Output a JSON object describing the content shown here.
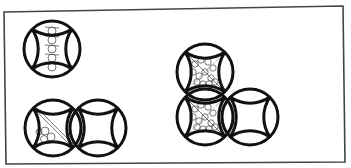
{
  "figure": {
    "width": 351,
    "height": 168,
    "background": "#ffffff",
    "stroke_color": "#111111",
    "frame": {
      "points": [
        [
          4,
          12
        ],
        [
          343,
          6
        ],
        [
          345,
          162
        ],
        [
          6,
          164
        ]
      ],
      "stroke_width": 1.6,
      "color": "#444444"
    },
    "motif_radius": 28,
    "motif_stroke_width": 3,
    "groups": [
      {
        "name": "single-motif",
        "motifs": [
          {
            "cx": 52,
            "cy": 49,
            "fill": "column-of-small-circles"
          }
        ]
      },
      {
        "name": "horizontal-pair",
        "motifs": [
          {
            "cx": 53,
            "cy": 128,
            "fill": "diagonal-with-small-circles"
          },
          {
            "cx": 98,
            "cy": 128,
            "fill": "none"
          }
        ]
      },
      {
        "name": "l-shaped-triple",
        "motifs": [
          {
            "cx": 205,
            "cy": 72,
            "fill": "stippled-circle-packing"
          },
          {
            "cx": 205,
            "cy": 117,
            "fill": "stippled-circle-packing"
          },
          {
            "cx": 250,
            "cy": 117,
            "fill": "none"
          }
        ]
      }
    ]
  }
}
